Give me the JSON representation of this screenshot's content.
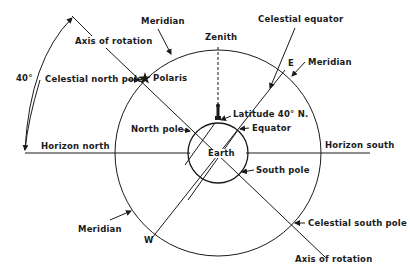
{
  "figure": {
    "type": "celestial-sphere-diagram",
    "colors": {
      "line": "#1a1a1a",
      "background": "#ffffff"
    }
  },
  "labels": {
    "angle": "40°",
    "axis_top": "Axis of rotation",
    "axis_bottom": "Axis of rotation",
    "meridian_top": "Meridian",
    "meridian_right": "Meridian",
    "meridian_left": "Meridian",
    "zenith": "Zenith",
    "celestial_equator": "Celestial equator",
    "east": "E",
    "west": "W",
    "celestial_north_pole": "Celestial north pole",
    "polaris": "Polaris",
    "latitude": "Latitude 40° N.",
    "equator": "Equator",
    "north_pole": "North pole",
    "earth": "Earth",
    "horizon_north": "Horizon north",
    "horizon_south": "Horizon south",
    "south_pole": "South pole",
    "celestial_south_pole": "Celestial south pole"
  }
}
